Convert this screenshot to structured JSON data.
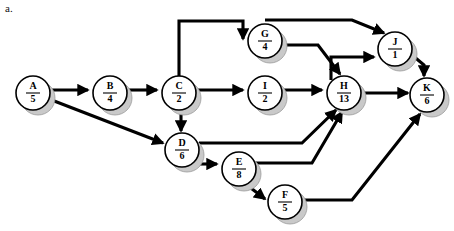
{
  "figure": {
    "label": "a.",
    "width": 454,
    "height": 231,
    "background": "#ffffff",
    "line_color": "#000000",
    "node_fill": "#ffffff",
    "node_shadow_color": "#c9c9c9"
  },
  "chart_data": {
    "type": "diagram",
    "diagram_type": "activity-on-node-network",
    "title": "",
    "node_radius": 17,
    "nodes": [
      {
        "id": "A",
        "activity": "A",
        "duration": "5",
        "cx": 33,
        "cy": 93
      },
      {
        "id": "B",
        "activity": "B",
        "duration": "4",
        "cx": 110,
        "cy": 93
      },
      {
        "id": "C",
        "activity": "C",
        "duration": "2",
        "cx": 179,
        "cy": 93
      },
      {
        "id": "D",
        "activity": "D",
        "duration": "6",
        "cx": 182,
        "cy": 150
      },
      {
        "id": "E",
        "activity": "E",
        "duration": "8",
        "cx": 239,
        "cy": 169
      },
      {
        "id": "F",
        "activity": "F",
        "duration": "5",
        "cx": 285,
        "cy": 202
      },
      {
        "id": "G",
        "activity": "G",
        "duration": "4",
        "cx": 265,
        "cy": 41
      },
      {
        "id": "I",
        "activity": "I",
        "duration": "2",
        "cx": 265,
        "cy": 93
      },
      {
        "id": "H",
        "activity": "H",
        "duration": "13",
        "cx": 344,
        "cy": 93
      },
      {
        "id": "J",
        "activity": "J",
        "duration": "1",
        "cx": 395,
        "cy": 49
      },
      {
        "id": "K",
        "activity": "K",
        "duration": "6",
        "cx": 427,
        "cy": 95
      }
    ],
    "edges": [
      {
        "from": "A",
        "to": "B",
        "path": "M 50 90 L 88 90"
      },
      {
        "from": "A",
        "to": "D",
        "path": "M 49 99 L 163 143"
      },
      {
        "from": "B",
        "to": "C",
        "path": "M 127 90 L 157 90"
      },
      {
        "from": "C",
        "to": "G",
        "path": "M 179 77 L 179 21 L 243 21 L 243 39"
      },
      {
        "from": "C",
        "to": "I",
        "path": "M 196 90 L 243 90"
      },
      {
        "from": "C",
        "to": "D",
        "path": "M 181 110 L 181 131"
      },
      {
        "from": "C",
        "to": "J",
        "path": "M 265 20 L 352 20 L 384 33"
      },
      {
        "from": "G",
        "to": "H",
        "path": "M 282 45 L 318 45 L 340 74"
      },
      {
        "from": "I",
        "to": "H",
        "path": "M 282 90 L 322 90"
      },
      {
        "from": "D",
        "to": "H",
        "path": "M 199 143 L 302 143 L 336 110"
      },
      {
        "from": "D",
        "to": "E",
        "path": "M 192 164 L 217 164"
      },
      {
        "from": "E",
        "to": "H",
        "path": "M 256 163 L 312 163 L 342 112"
      },
      {
        "from": "E",
        "to": "F",
        "path": "M 247 185 L 265 199"
      },
      {
        "from": "F",
        "to": "K",
        "path": "M 302 200 L 352 200 L 420 114"
      },
      {
        "from": "H",
        "to": "J",
        "path": "M 331 80 L 331 57 L 374 57"
      },
      {
        "from": "H",
        "to": "K",
        "path": "M 361 93 L 408 93"
      },
      {
        "from": "J",
        "to": "K",
        "path": "M 412 55 L 424 65 L 424 76"
      }
    ],
    "edge_list_text": "A→B, A→D, B→C, C→G, C→I, C→D, C→J, G→H, I→H, D→H, D→E, E→H, E→F, F→K, H→J, H→K, J→K"
  }
}
